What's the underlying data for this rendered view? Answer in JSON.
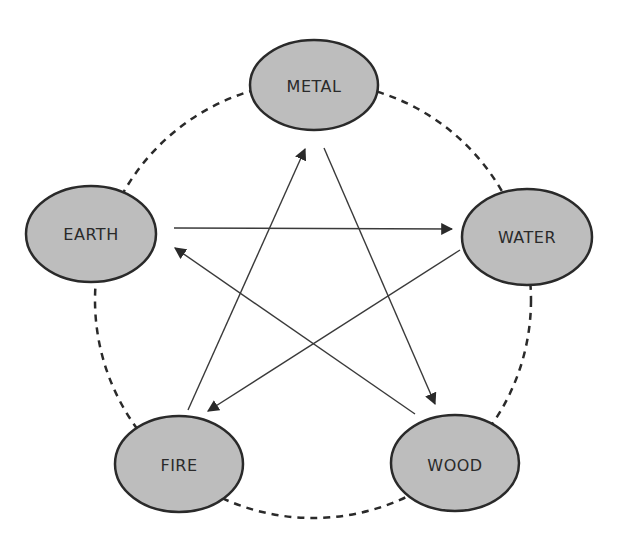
{
  "diagram": {
    "type": "five-elements-cycle",
    "colors": {
      "node_fill": "#bdbdbd",
      "node_stroke": "#2a2a2a",
      "line": "#3a3a3a",
      "background": "#ffffff"
    },
    "nodes": [
      {
        "id": "metal",
        "label": "METAL",
        "cx": 314,
        "cy": 85,
        "rx": 64,
        "ry": 45
      },
      {
        "id": "water",
        "label": "WATER",
        "cx": 527,
        "cy": 237,
        "rx": 65,
        "ry": 48
      },
      {
        "id": "wood",
        "label": "WOOD",
        "cx": 455,
        "cy": 463,
        "rx": 64,
        "ry": 48
      },
      {
        "id": "fire",
        "label": "FIRE",
        "cx": 179,
        "cy": 464,
        "rx": 64,
        "ry": 48
      },
      {
        "id": "earth",
        "label": "EARTH",
        "cx": 91,
        "cy": 234,
        "rx": 65,
        "ry": 48
      }
    ],
    "outer_cycle": {
      "style": "dashed",
      "order": [
        "metal",
        "water",
        "wood",
        "fire",
        "earth"
      ]
    },
    "arrows": [
      {
        "from": "earth",
        "to": "water"
      },
      {
        "from": "water",
        "to": "fire"
      },
      {
        "from": "fire",
        "to": "metal"
      },
      {
        "from": "metal",
        "to": "wood"
      },
      {
        "from": "wood",
        "to": "earth"
      }
    ]
  }
}
